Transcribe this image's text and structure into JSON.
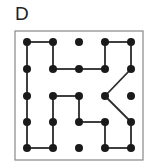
{
  "label": "D",
  "grid": {
    "cols": 5,
    "rows": 5,
    "x": [
      27,
      53,
      79,
      105,
      131
    ],
    "y": [
      42,
      69,
      96,
      122,
      148
    ],
    "dot_radius": 4,
    "dot_color": "#1a1a1a",
    "line_color": "#2a2a2a"
  },
  "frame": {
    "x": 15,
    "y": 31,
    "w": 128,
    "h": 129,
    "color": "#888888"
  },
  "edges": [
    [
      [
        0,
        0
      ],
      [
        1,
        0
      ]
    ],
    [
      [
        1,
        0
      ],
      [
        1,
        1
      ]
    ],
    [
      [
        1,
        1
      ],
      [
        2,
        1
      ]
    ],
    [
      [
        2,
        1
      ],
      [
        3,
        1
      ]
    ],
    [
      [
        3,
        1
      ],
      [
        3,
        0
      ]
    ],
    [
      [
        3,
        0
      ],
      [
        4,
        0
      ]
    ],
    [
      [
        4,
        0
      ],
      [
        4,
        1
      ]
    ],
    [
      [
        4,
        1
      ],
      [
        3,
        2
      ]
    ],
    [
      [
        3,
        2
      ],
      [
        4,
        3
      ]
    ],
    [
      [
        4,
        3
      ],
      [
        4,
        4
      ]
    ],
    [
      [
        4,
        4
      ],
      [
        3,
        4
      ]
    ],
    [
      [
        3,
        4
      ],
      [
        3,
        3
      ]
    ],
    [
      [
        3,
        3
      ],
      [
        2,
        3
      ]
    ],
    [
      [
        2,
        3
      ],
      [
        2,
        2
      ]
    ],
    [
      [
        2,
        2
      ],
      [
        1,
        2
      ]
    ],
    [
      [
        1,
        2
      ],
      [
        1,
        3
      ]
    ],
    [
      [
        1,
        3
      ],
      [
        1,
        4
      ]
    ],
    [
      [
        1,
        4
      ],
      [
        0,
        4
      ]
    ],
    [
      [
        0,
        4
      ],
      [
        0,
        3
      ]
    ],
    [
      [
        0,
        3
      ],
      [
        0,
        2
      ]
    ],
    [
      [
        0,
        2
      ],
      [
        0,
        1
      ]
    ],
    [
      [
        0,
        1
      ],
      [
        0,
        0
      ]
    ]
  ]
}
